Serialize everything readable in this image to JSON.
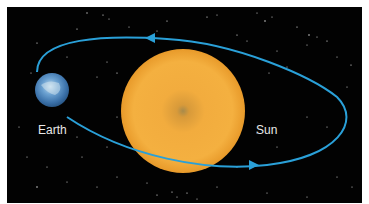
{
  "diagram": {
    "labels": {
      "earth": "Earth",
      "sun": "Sun"
    },
    "bodies": [
      {
        "name": "Sun",
        "color": "#f0a83a",
        "center_color": "#a08050"
      },
      {
        "name": "Earth",
        "color": "#5a90c8"
      }
    ],
    "orbit": {
      "color": "#2aa0d8",
      "direction": "counter-clockwise"
    },
    "background_color": "#020202"
  }
}
